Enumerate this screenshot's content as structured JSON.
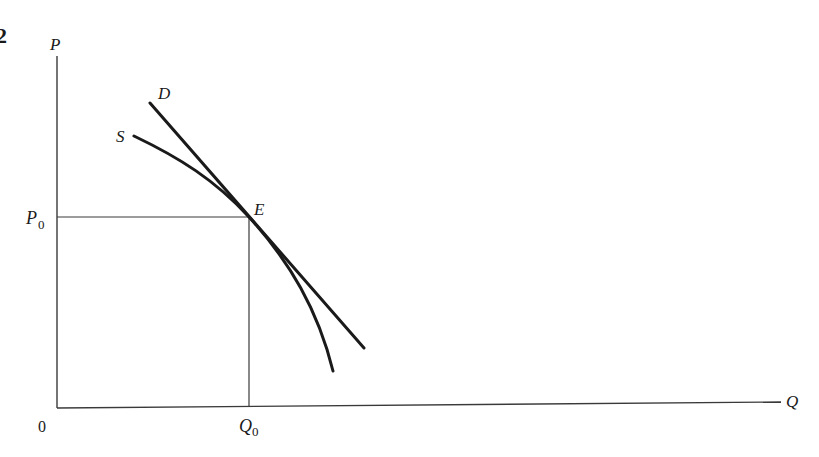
{
  "figure": {
    "number_fragment": "2",
    "type": "supply-demand diagram"
  },
  "axes": {
    "y_label": "P",
    "x_label": "Q",
    "origin_label": "0"
  },
  "curves": {
    "demand_label": "D",
    "supply_label": "S"
  },
  "equilibrium": {
    "point_label": "E",
    "price_label_main": "P",
    "price_label_sub": "0",
    "quantity_label_main": "Q",
    "quantity_label_sub": "0"
  },
  "colors": {
    "ink": "#1a1a1a",
    "axis": "#3a3a3a",
    "background": "#ffffff"
  }
}
